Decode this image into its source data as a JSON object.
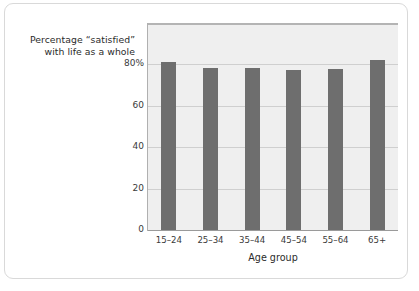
{
  "chart_data": {
    "type": "bar",
    "title": "",
    "subtitle": "",
    "categories": [
      "15–24",
      "25–34",
      "35–44",
      "45–54",
      "55–64",
      "65+"
    ],
    "values": [
      81,
      78.5,
      78.5,
      77.5,
      78,
      82
    ],
    "series": [
      {
        "name": "Percentage “satisfied” with life as a whole",
        "values": [
          81,
          78.5,
          78.5,
          77.5,
          78,
          82
        ]
      }
    ],
    "xlabel": "Age group",
    "ylabel": "Percentage “satisfied” with life as a whole",
    "ylabel_lines": [
      "Percentage “satisfied”",
      "with life as a whole"
    ],
    "ylim": [
      0,
      100
    ],
    "yticks": [
      0,
      20,
      40,
      60,
      80
    ],
    "ytick_labels": [
      "0",
      "20",
      "40",
      "60",
      "80%"
    ],
    "grid": true,
    "grid_axis": "y",
    "legend": false,
    "legend_position": "none",
    "bar_color": "#6e6e6e",
    "plot_background": "#efefef",
    "gridline_color": "#cfcfcf",
    "axis_color": "#9a9a9a",
    "card_border_color": "#d9d9d9"
  }
}
